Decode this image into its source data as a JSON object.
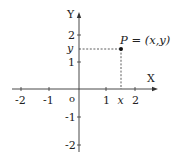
{
  "diagram": {
    "type": "cartesian-coordinate-plane",
    "axes": {
      "x_label": "X",
      "y_label": "Y",
      "origin_label": "o"
    },
    "x_ticks": [
      {
        "value": -2,
        "label": "-2"
      },
      {
        "value": -1,
        "label": "-1"
      },
      {
        "value": 1,
        "label": "1"
      },
      {
        "value": 2,
        "label": "2"
      }
    ],
    "y_ticks": [
      {
        "value": 2,
        "label": "2"
      },
      {
        "value": 1,
        "label": "1"
      },
      {
        "value": -1,
        "label": "-1"
      },
      {
        "value": -2,
        "label": "-2"
      }
    ],
    "point": {
      "label": "P = (x,y)",
      "x_marker_label": "x",
      "y_marker_label": "y",
      "x_value": 1.5,
      "y_value": 1.5
    }
  }
}
